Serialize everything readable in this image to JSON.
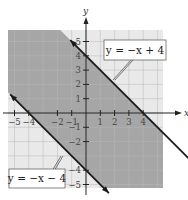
{
  "chart_data": {
    "type": "area",
    "title": "",
    "xlabel": "x",
    "ylabel": "y",
    "xlim": [
      -5.5,
      5.5
    ],
    "ylim": [
      -5.5,
      5.5
    ],
    "grid": true,
    "x_ticks": [
      -5,
      -4,
      -2,
      -1,
      1,
      2,
      3,
      4
    ],
    "x_tick_labels": [
      "−5",
      "−4",
      "−2",
      "−1",
      "1",
      "2",
      "3",
      "4"
    ],
    "y_ticks": [
      5,
      4,
      3,
      2,
      1,
      -1,
      -2,
      -4,
      -5
    ],
    "y_tick_labels": [
      "5",
      "4",
      "3",
      "2",
      "1",
      "−1",
      "−2",
      "−4",
      "−5"
    ],
    "series": [
      {
        "name": "y = −x + 4",
        "slope": -1,
        "intercept": 4,
        "style": "solid"
      },
      {
        "name": "y = −x − 4",
        "slope": -1,
        "intercept": -4,
        "style": "solid"
      }
    ],
    "shaded_region": "−x − 4 ≤ y ≤ −x + 4",
    "annotations": [
      {
        "text": "y = −x + 4",
        "points_to": "upper line",
        "placement": "top-right"
      },
      {
        "text": "y = −x − 4",
        "points_to": "lower line",
        "placement": "bottom-left"
      }
    ],
    "colors": {
      "shade": "#a6a6a6",
      "grid": "#c8c8c8",
      "line": "#1a1a1a",
      "axis": "#222222"
    }
  }
}
